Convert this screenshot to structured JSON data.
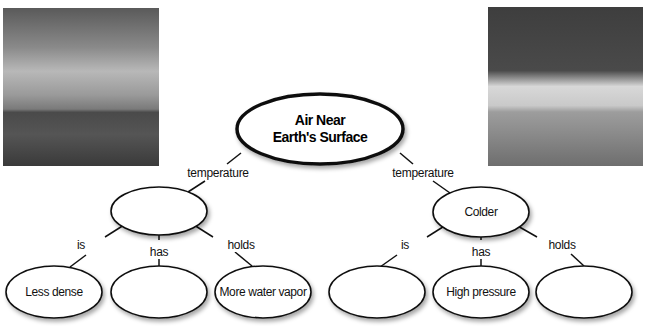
{
  "photos": {
    "left": {
      "description": "Stormy sky over highway with truck"
    },
    "right": {
      "description": "Clouds over grassy field"
    }
  },
  "main_node": {
    "line1": "Air Near",
    "line2": "Earth's Surface"
  },
  "branches": {
    "left": {
      "link_label": "temperature",
      "node_label": "",
      "children": [
        {
          "link": "is",
          "label": "Less dense"
        },
        {
          "link": "has",
          "label": ""
        },
        {
          "link": "holds",
          "label": "More water vapor"
        }
      ]
    },
    "right": {
      "link_label": "temperature",
      "node_label": "Colder",
      "children": [
        {
          "link": "is",
          "label": ""
        },
        {
          "link": "has",
          "label": "High pressure"
        },
        {
          "link": "holds",
          "label": ""
        }
      ]
    }
  },
  "colors": {
    "stroke": "#111111",
    "background": "#ffffff"
  }
}
